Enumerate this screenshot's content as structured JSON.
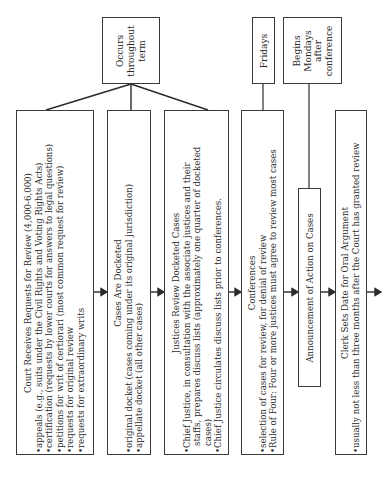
{
  "diagram": {
    "title_fragment": "",
    "timing_boxes": {
      "throughout_term": [
        "Occurs",
        "throughout",
        "term"
      ],
      "fridays": [
        "Fridays"
      ],
      "begins_mondays": [
        "Begins",
        "Mondays",
        "after",
        "conference"
      ]
    },
    "steps": [
      {
        "title": "Court Receives Requests for Review (4,000-6,000)",
        "bullets": [
          "appeals (e.g., suits under the Civil Rights and Voting Rights Acts)",
          "certification (requests by lower courts for answers to legal questions)",
          "petitions for writ of certiorari (most common request for review)",
          "requests for original review",
          "requests for extraordinary writs"
        ]
      },
      {
        "title": "Cases Are Docketed",
        "bullets": [
          "original docket (cases coming under its original jurisdiction)",
          "appellate docket (all other cases)"
        ]
      },
      {
        "title": "Justices Review Docketed Cases",
        "bullets": [
          "Chief Justice, in consultation with the associate justices and their staffs, prepares discuss lists (approximately one quarter of docketed cases)",
          "Chief Justice circulates discuss lists prior to conferences."
        ],
        "bullet_lines": [
          [
            "Chief Justice, in consultation with the associate justices and their",
            "staffs, prepares discuss lists (approximately one quarter of docketed",
            "cases)"
          ],
          [
            "Chief Justice circulates discuss lists prior to conferences."
          ]
        ]
      },
      {
        "title": "Conferences",
        "bullets": [
          "selection of cases for review, for denial of review",
          "Rule of Four: Four or more justices must agree to review most cases"
        ]
      },
      {
        "title": "Announcement of Action on Cases",
        "bullets": []
      },
      {
        "title": "Clerk Sets Date for Oral Argument",
        "bullets": [
          "usually not less than three months after the Court has granted review"
        ]
      }
    ],
    "bullet_char": "•",
    "colors": {
      "line": "#2a2a2a",
      "border": "#3a3a3a",
      "text": "#2a2a2a",
      "background": "#ffffff"
    }
  }
}
